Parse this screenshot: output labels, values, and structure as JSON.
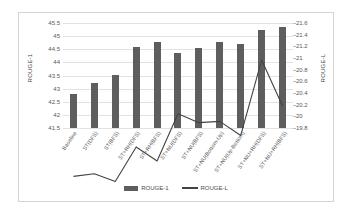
{
  "chart_data": {
    "type": "bar",
    "title": "",
    "xlabel": "",
    "ylabel": "ROUGE-1",
    "y2label": "ROUGE-L",
    "grid": true,
    "legend_position": "bottom",
    "ylim": [
      41.5,
      45.5
    ],
    "y2lim": [
      19.8,
      21.6
    ],
    "yticks": [
      "41.5",
      "42",
      "42.5",
      "43",
      "43.5",
      "44",
      "44.5",
      "45",
      "45.5"
    ],
    "y2ticks": [
      "19.8",
      "20",
      "20.2",
      "20.4",
      "20.6",
      "20.8",
      "21",
      "21.2",
      "21.4",
      "21.6"
    ],
    "categories": [
      "Baseline",
      "ST(DFS)",
      "ST(BFS)",
      "ST+RH(DFS)",
      "ST+RH(BFS)",
      "ST+NU(DFS)",
      "ST+NU(BFS)",
      "ST+NU(Bottom-Up)",
      "ST+NU(Up-Bottom)",
      "ST+NU+RH(DFS)",
      "ST+NU+RH(BFS)"
    ],
    "series": [
      {
        "name": "ROUGE-1",
        "axis": "left",
        "type": "bar",
        "color": "#5e5e5e",
        "values": [
          42.8,
          43.2,
          43.52,
          44.58,
          44.78,
          44.35,
          44.54,
          44.79,
          44.71,
          45.25,
          45.35
        ]
      },
      {
        "name": "ROUGE-L",
        "axis": "right",
        "type": "line",
        "color": "#434343",
        "values": [
          20.4,
          20.42,
          20.36,
          20.63,
          20.52,
          20.89,
          20.82,
          20.83,
          20.72,
          21.31,
          20.95
        ]
      }
    ]
  },
  "legend": {
    "items": [
      {
        "label": "ROUGE-1",
        "marker": "bar-swatch"
      },
      {
        "label": "ROUGE-L",
        "marker": "line-swatch"
      }
    ]
  }
}
